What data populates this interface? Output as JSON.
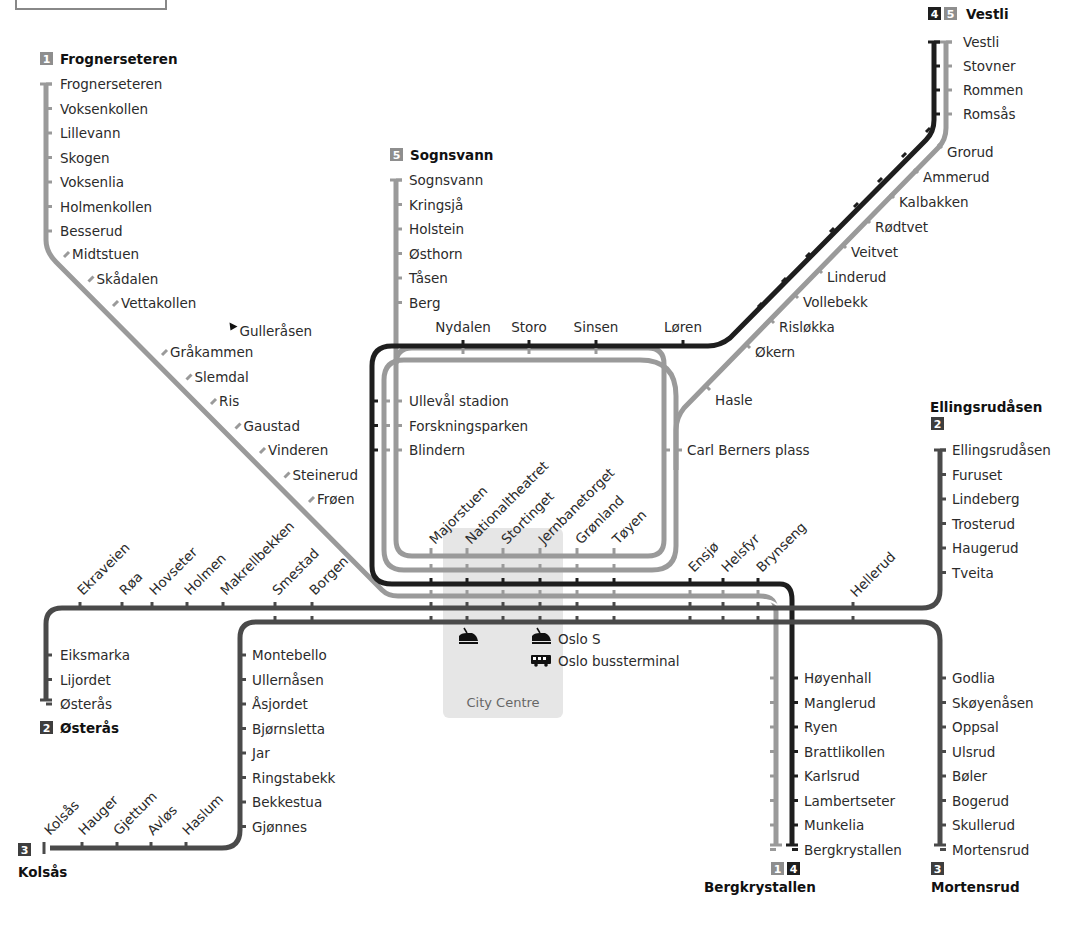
{
  "colors": {
    "line_light": "#9a9a9a",
    "line_mid": "#4a4a4a",
    "line_dark": "#1e1e1e",
    "city_centre_bg": "#e6e6e6",
    "text": "#2b2b2b"
  },
  "terminals": {
    "frognerseteren": {
      "badges": [
        "1"
      ],
      "name": "Frognerseteren"
    },
    "sognsvann": {
      "badges": [
        "5"
      ],
      "name": "Sognsvann"
    },
    "vestli": {
      "badges": [
        "4",
        "5"
      ],
      "name": "Vestli"
    },
    "ellingsrudasen": {
      "badges": [
        "2"
      ],
      "name": "Ellingsrudåsen"
    },
    "osteras": {
      "badges": [
        "2"
      ],
      "name": "Østerås"
    },
    "kolsas": {
      "badges": [
        "3"
      ],
      "name": "Kolsås"
    },
    "bergkrystallen": {
      "badges": [
        "1",
        "4"
      ],
      "name": "Bergkrystallen"
    },
    "mortensrud": {
      "badges": [
        "3"
      ],
      "name": "Mortensrud"
    }
  },
  "branches": {
    "holmenkollen": [
      "Frognerseteren",
      "Voksenkollen",
      "Lillevann",
      "Skogen",
      "Voksenlia",
      "Holmenkollen",
      "Besserud"
    ],
    "holmenkollen_diag": [
      "Midtstuen",
      "Skådalen",
      "Vettakollen",
      "Gulleråsen",
      "Gråkammen",
      "Slemdal",
      "Ris",
      "Gaustad",
      "Vinderen",
      "Steinerud",
      "Frøen"
    ],
    "sognsvann": [
      "Sognsvann",
      "Kringsjå",
      "Holstein",
      "Østhorn",
      "Tåsen",
      "Berg"
    ],
    "ring_top": [
      "Nydalen",
      "Storo",
      "Sinsen",
      "Løren"
    ],
    "ring_left": [
      "Ullevål stadion",
      "Forskningsparken",
      "Blindern"
    ],
    "ring_right": [
      "Carl Berners plass"
    ],
    "grorud_top": [
      "Vestli",
      "Stovner",
      "Rommen",
      "Romsås"
    ],
    "grorud_diag": [
      "Grorud",
      "Ammerud",
      "Kalbakken",
      "Rødtvet",
      "Veitvet",
      "Linderud",
      "Vollebekk",
      "Risløkka",
      "Økern",
      "Hasle"
    ],
    "common_tunnel": [
      "Majorstuen",
      "Nationaltheatret",
      "Stortinget",
      "Jernbanetorget",
      "Grønland",
      "Tøyen"
    ],
    "east_common": [
      "Ensjø",
      "Helsfyr",
      "Brynseng"
    ],
    "furuset_diag": [
      "Hellerud"
    ],
    "furuset": [
      "Ellingsrudåsen",
      "Furuset",
      "Lindeberg",
      "Trosterud",
      "Haugerud",
      "Tveita"
    ],
    "osteras_diag": [
      "Ekraveien",
      "Røa",
      "Hovseter",
      "Holmen",
      "Makrellbekken",
      "Smestad",
      "Borgen"
    ],
    "osteras": [
      "Eiksmarka",
      "Lijordet",
      "Østerås"
    ],
    "kolsas": [
      "Montebello",
      "Ullernåsen",
      "Åsjordet",
      "Bjørnsletta",
      "Jar",
      "Ringstabekk",
      "Bekkestua",
      "Gjønnes"
    ],
    "kolsas_diag": [
      "Kolsås",
      "Hauger",
      "Gjettum",
      "Avløs",
      "Haslum"
    ],
    "ostensjo": [
      "Godlia",
      "Skøyenåsen",
      "Oppsal",
      "Ulsrud",
      "Bøler",
      "Bogerud",
      "Skullerud",
      "Mortensrud"
    ],
    "lambertseter": [
      "Høyenhall",
      "Manglerud",
      "Ryen",
      "Brattlikollen",
      "Karlsrud",
      "Lambertseter",
      "Munkelia",
      "Bergkrystallen"
    ]
  },
  "city_centre": {
    "label": "City Centre",
    "transfers": [
      {
        "icon": "train-icon",
        "label": "Oslo S"
      },
      {
        "icon": "bus-icon",
        "label": "Oslo bussterminal"
      }
    ]
  }
}
